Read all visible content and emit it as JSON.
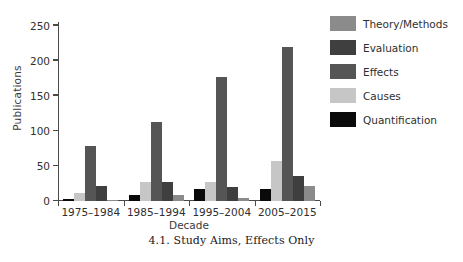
{
  "chart_data": {
    "type": "bar",
    "title": "",
    "xlabel": "Decade",
    "ylabel": "Publications",
    "categories": [
      "1975–1984",
      "1985–1994",
      "1995–2004",
      "2005–2015"
    ],
    "yticks": [
      0,
      50,
      100,
      150,
      200,
      250
    ],
    "ylim": [
      0,
      255
    ],
    "grid": false,
    "legend_position": "right",
    "series": [
      {
        "name": "Theory/Methods",
        "color": "#8b8b8b",
        "values": [
          0,
          0,
          0,
          0
        ]
      },
      {
        "name": "Evaluation",
        "color": "#3f3f3f",
        "values": [
          3,
          9,
          17,
          17
        ]
      },
      {
        "name": "Effects",
        "color": "#555555",
        "values": [
          78,
          112,
          177,
          220
        ]
      },
      {
        "name": "Causes",
        "color": "#c6c6c6",
        "values": [
          12,
          27,
          27,
          57
        ]
      },
      {
        "name": "Quantification",
        "color": "#0a0a0a",
        "values": [
          0,
          0,
          0,
          0
        ]
      }
    ],
    "bars": [
      {
        "group": "1975–1984",
        "items": [
          {
            "series": "Quantification",
            "value": 3,
            "color": "#0a0a0a"
          },
          {
            "series": "Causes",
            "value": 12,
            "color": "#c6c6c6"
          },
          {
            "series": "Effects",
            "value": 78,
            "color": "#555555"
          },
          {
            "series": "Evaluation",
            "value": 22,
            "color": "#3f3f3f"
          },
          {
            "series": "Theory/Methods",
            "value": 2,
            "color": "#8b8b8b"
          }
        ]
      },
      {
        "group": "1985–1994",
        "items": [
          {
            "series": "Quantification",
            "value": 9,
            "color": "#0a0a0a"
          },
          {
            "series": "Causes",
            "value": 27,
            "color": "#c6c6c6"
          },
          {
            "series": "Effects",
            "value": 112,
            "color": "#555555"
          },
          {
            "series": "Evaluation",
            "value": 27,
            "color": "#3f3f3f"
          },
          {
            "series": "Theory/Methods",
            "value": 9,
            "color": "#8b8b8b"
          }
        ]
      },
      {
        "group": "1995–2004",
        "items": [
          {
            "series": "Quantification",
            "value": 17,
            "color": "#0a0a0a"
          },
          {
            "series": "Causes",
            "value": 27,
            "color": "#c6c6c6"
          },
          {
            "series": "Effects",
            "value": 177,
            "color": "#555555"
          },
          {
            "series": "Evaluation",
            "value": 20,
            "color": "#3f3f3f"
          },
          {
            "series": "Theory/Methods",
            "value": 4,
            "color": "#8b8b8b"
          }
        ]
      },
      {
        "group": "2005–2015",
        "items": [
          {
            "series": "Quantification",
            "value": 17,
            "color": "#0a0a0a"
          },
          {
            "series": "Causes",
            "value": 57,
            "color": "#c6c6c6"
          },
          {
            "series": "Effects",
            "value": 220,
            "color": "#555555"
          },
          {
            "series": "Evaluation",
            "value": 35,
            "color": "#3f3f3f"
          },
          {
            "series": "Theory/Methods",
            "value": 22,
            "color": "#8b8b8b"
          }
        ]
      }
    ]
  },
  "legend": {
    "entries": [
      {
        "label": "Theory/Methods",
        "color": "#8b8b8b"
      },
      {
        "label": "Evaluation",
        "color": "#3f3f3f"
      },
      {
        "label": "Effects",
        "color": "#555555"
      },
      {
        "label": "Causes",
        "color": "#c6c6c6"
      },
      {
        "label": "Quantification",
        "color": "#0a0a0a"
      }
    ]
  },
  "caption": {
    "text": "4.1.  Study Aims, Effects Only"
  }
}
